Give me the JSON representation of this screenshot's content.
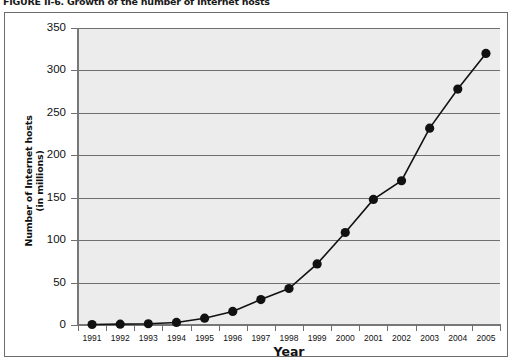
{
  "figure": {
    "caption": "FIGURE II-6. Growth of the number of Internet hosts"
  },
  "chart_data": {
    "type": "line",
    "title": "Growth of the number of Internet hosts",
    "xlabel": "Year",
    "ylabel": "Number of Internet hosts (in millions)",
    "ylabel_line1": "Number of Internet hosts",
    "ylabel_line2": "(in millions)",
    "categories": [
      "1991",
      "1992",
      "1993",
      "1994",
      "1995",
      "1996",
      "1997",
      "1998",
      "1999",
      "2000",
      "2001",
      "2002",
      "2003",
      "2004",
      "2005"
    ],
    "values": [
      0.6,
      1,
      1.5,
      3,
      8,
      16,
      30,
      43,
      72,
      109,
      148,
      170,
      232,
      278,
      320
    ],
    "ylim": [
      0,
      350
    ],
    "ytick_values": [
      0,
      50,
      100,
      150,
      200,
      250,
      300,
      350
    ],
    "ytick_labels": [
      "0",
      "50",
      "100",
      "150",
      "200",
      "250",
      "300",
      "350"
    ],
    "grid": true,
    "legend": "none",
    "marker": "filled-circle",
    "series_color": "#111111",
    "plot_background": "#ececec",
    "gridline_color": "#6f6f6f"
  }
}
